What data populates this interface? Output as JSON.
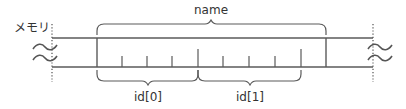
{
  "diagram": {
    "type": "memory-layout",
    "memory_label": "メモリ",
    "struct_label": "name",
    "fields": [
      {
        "label": "id[0]"
      },
      {
        "label": "id[1]"
      }
    ],
    "colors": {
      "line": "#5a5a5a",
      "text": "#333333",
      "background": "#ffffff"
    },
    "tick_counts": {
      "cells_per_field": 4,
      "fields": 2
    }
  }
}
